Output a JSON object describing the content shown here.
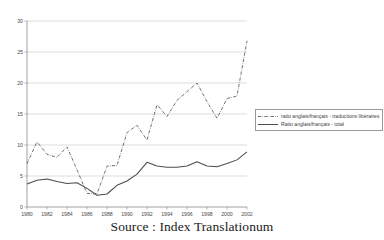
{
  "header": {
    "faint_top_text": ""
  },
  "caption": {
    "text": "Source : Index Translationum"
  },
  "legend": {
    "position": "right-middle",
    "items": [
      {
        "label": "ratio anglais/français - traductions littéraires",
        "style": "dash-dot",
        "color": "#55555a"
      },
      {
        "label": "Ratio anglais/français - total",
        "style": "solid",
        "color": "#4b4b50"
      }
    ]
  },
  "chart_data": {
    "type": "line",
    "title": "",
    "subtitle": "",
    "xlabel": "",
    "ylabel": "",
    "xlim": [
      1980,
      2002
    ],
    "ylim": [
      0,
      30
    ],
    "ytick_step": 5,
    "xtick_step": 2,
    "grid": true,
    "yticks": [
      0,
      5,
      10,
      15,
      20,
      25,
      30
    ],
    "xticks": [
      1980,
      1982,
      1984,
      1986,
      1988,
      1990,
      1992,
      1994,
      1996,
      1998,
      2000,
      2002
    ],
    "x": [
      1980,
      1981,
      1982,
      1983,
      1984,
      1985,
      1986,
      1987,
      1988,
      1989,
      1990,
      1991,
      1992,
      1993,
      1994,
      1995,
      1996,
      1997,
      1998,
      1999,
      2000,
      2001,
      2002
    ],
    "series": [
      {
        "name": "ratio anglais/français - traductions littéraires",
        "style": "dash-dot",
        "color": "#55555a",
        "values": [
          7.0,
          10.5,
          8.5,
          8.0,
          9.7,
          6.0,
          2.2,
          2.1,
          6.6,
          6.7,
          12.0,
          13.2,
          10.8,
          16.5,
          14.6,
          17.2,
          18.6,
          20.0,
          17.0,
          14.3,
          17.5,
          17.9,
          26.8
        ]
      },
      {
        "name": "Ratio anglais/français - total",
        "style": "solid",
        "color": "#4b4b50",
        "values": [
          3.7,
          4.3,
          4.5,
          4.1,
          3.8,
          3.9,
          3.0,
          1.9,
          2.1,
          3.5,
          4.2,
          5.3,
          7.2,
          6.6,
          6.4,
          6.4,
          6.6,
          7.3,
          6.6,
          6.5,
          7.0,
          7.6,
          8.9
        ]
      }
    ],
    "annotations": []
  },
  "geometry": {
    "plot_left": 27,
    "plot_right": 247,
    "plot_top": 21,
    "plot_bottom": 207
  }
}
